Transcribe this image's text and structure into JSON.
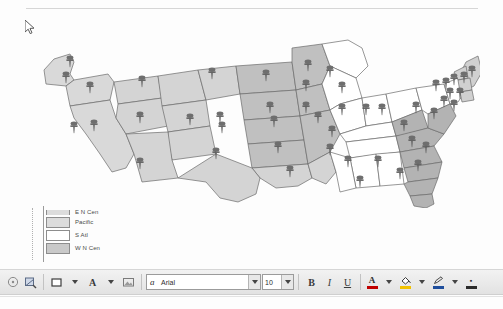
{
  "document": {
    "type": "us-choropleth-map-with-pushpins",
    "cursor_icon": "mouse-pointer-icon"
  },
  "map": {
    "title": "",
    "region_fills": {
      "pacific": "#d9d9d9",
      "mountain": "#d4d4d4",
      "west_north_central": "#c0c0c0",
      "west_south_central": "#d4d4d4",
      "east_north_central": "#ffffff",
      "east_south_central": "#ffffff",
      "south_atlantic": "#b3b3b3",
      "middle_atlantic": "#ffffff",
      "new_england": "#d0d0d0"
    },
    "border_color": "#6b6b6b",
    "pin_color": "#696969",
    "pin_count": 48
  },
  "legend": {
    "title": "",
    "items": [
      {
        "label": "E N Cen",
        "swatch": "#dcdcdc",
        "clipped": true
      },
      {
        "label": "Pacific",
        "swatch": "#dcdcdc",
        "clipped": false
      },
      {
        "label": "S Atl",
        "swatch": "#ffffff",
        "clipped": false
      },
      {
        "label": "W N Cen",
        "swatch": "#c9c9c9",
        "clipped": false
      }
    ]
  },
  "toolbar": {
    "name": "drawing-formatting-toolbar",
    "select_label": "",
    "fill_effects_label": "",
    "shape_label": "",
    "wordart_label": "A",
    "insert_label": "",
    "font_name": "Arial",
    "font_size": "10",
    "bold_label": "B",
    "italic_label": "I",
    "underline_label": "U",
    "font_color_label": "A",
    "font_color_swatch": "#c00000",
    "fill_color_label": "",
    "fill_color_swatch": "#f2c200",
    "line_color_label": "",
    "line_color_swatch": "#1f4e9c",
    "border_color_label": "",
    "border_color_swatch": "#2b2b2b"
  }
}
